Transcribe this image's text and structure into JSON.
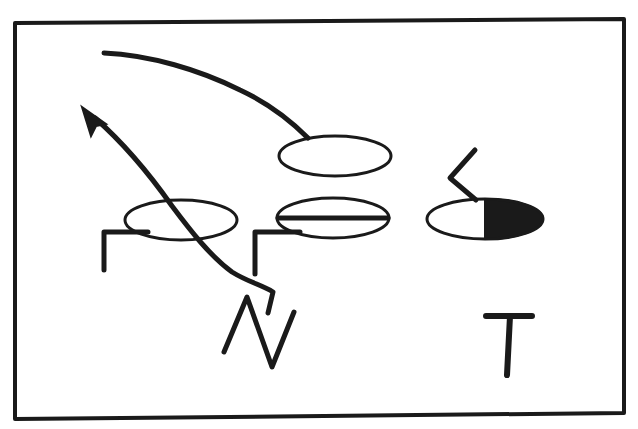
{
  "diagram": {
    "type": "play-diagram",
    "colors": {
      "ink": "#1a1a1a",
      "paper": "#ffffff"
    },
    "labels": {
      "n_label": "N",
      "t_label": "T"
    },
    "caption": "",
    "elements": [
      {
        "id": "frame",
        "kind": "rectangle-border"
      },
      {
        "id": "player-top-center",
        "kind": "open-oval"
      },
      {
        "id": "player-left",
        "kind": "open-oval"
      },
      {
        "id": "player-center",
        "kind": "oval-with-bar"
      },
      {
        "id": "player-right",
        "kind": "half-filled-oval"
      },
      {
        "id": "route-curve-top",
        "kind": "curved-line"
      },
      {
        "id": "route-arrow",
        "kind": "arrow-path"
      },
      {
        "id": "block-mark-left",
        "kind": "corner-mark"
      },
      {
        "id": "block-mark-center",
        "kind": "corner-mark"
      },
      {
        "id": "block-mark-right",
        "kind": "zigzag-mark"
      },
      {
        "id": "letter-n",
        "kind": "drawn-letter"
      },
      {
        "id": "letter-t",
        "kind": "drawn-letter"
      }
    ]
  }
}
